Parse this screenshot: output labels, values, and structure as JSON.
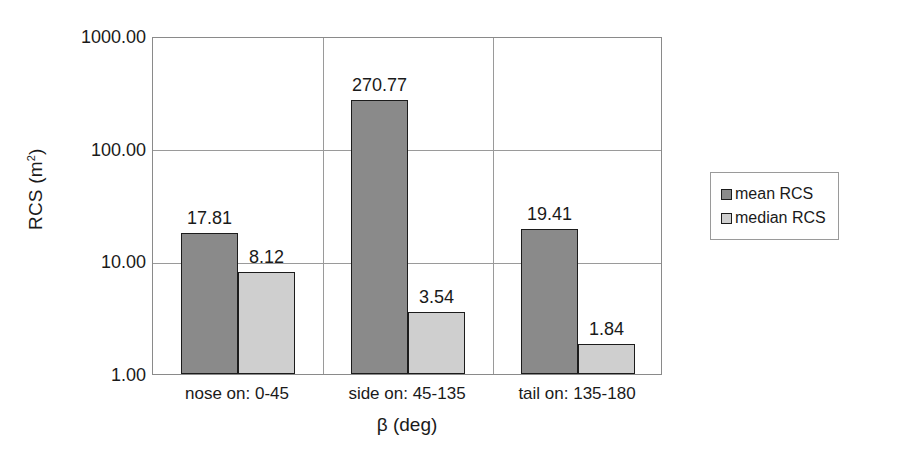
{
  "chart_data": {
    "type": "bar",
    "title": "",
    "xlabel": "β (deg)",
    "ylabel": "RCS (m²)",
    "ylabel_base": "RCS (m",
    "ylabel_sup": "2",
    "ylabel_close": ")",
    "yscale": "log",
    "ylim": [
      1.0,
      1000.0
    ],
    "grid": true,
    "categories": [
      "nose on:  0-45",
      "side on: 45-135",
      "tail on: 135-180"
    ],
    "y_ticks": [
      "1000.00",
      "100.00",
      "10.00",
      "1.00"
    ],
    "y_tick_values": [
      1000.0,
      100.0,
      10.0,
      1.0
    ],
    "legend_position": "right",
    "series": [
      {
        "name": "mean RCS",
        "color": "#8a8a8a",
        "values": [
          17.81,
          270.77,
          19.41
        ],
        "labels": [
          "17.81",
          "270.77",
          "19.41"
        ]
      },
      {
        "name": "median RCS",
        "color": "#cfcfcf",
        "values": [
          8.12,
          3.54,
          1.84
        ],
        "labels": [
          "8.12",
          "3.54",
          "1.84"
        ]
      }
    ]
  },
  "legend": {
    "items": [
      {
        "label": "mean RCS",
        "swatch": "mean"
      },
      {
        "label": "median RCS",
        "swatch": "median"
      }
    ]
  },
  "axes": {
    "y_title": "RCS (m",
    "y_title_sup": "2",
    "y_title_end": ")",
    "x_title": "β (deg)"
  },
  "colors": {
    "mean_bar": "#8a8a8a",
    "median_bar": "#cfcfcf",
    "bar_outline": "#1c1c1c",
    "gridline": "#9a9a9a",
    "plot_border": "#8a8a8a",
    "text": "#1a1a1a",
    "background": "#ffffff"
  }
}
